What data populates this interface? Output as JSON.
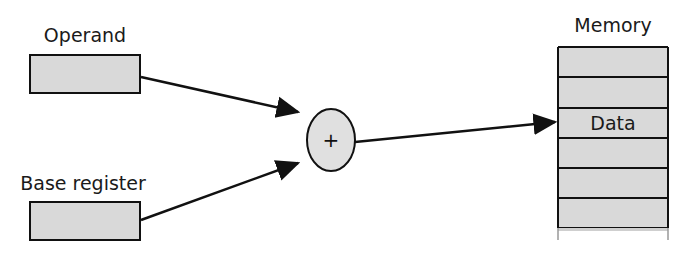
{
  "diagram": {
    "operand": {
      "label": "Operand"
    },
    "base_register": {
      "label": "Base register"
    },
    "adder": {
      "symbol": "+"
    },
    "memory": {
      "label": "Memory",
      "cells": [
        "",
        "",
        "Data",
        "",
        "",
        ""
      ],
      "highlight_label": "Data"
    },
    "colors": {
      "box_fill": "#d9d9d9",
      "stroke": "#111111",
      "adder_fill": "#e0e0e0"
    }
  }
}
